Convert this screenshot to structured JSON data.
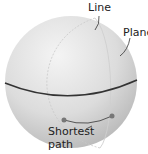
{
  "diagram": {
    "labels": {
      "line": "Line",
      "plane": "Plane",
      "shortest_path_1": "Shortest",
      "shortest_path_2": "path"
    },
    "colors": {
      "sphere_light": "#f2f2f2",
      "sphere_dark": "#bdbdbd",
      "equator": "#333333",
      "meridian": "#c8c8c8",
      "point": "#777777"
    }
  }
}
